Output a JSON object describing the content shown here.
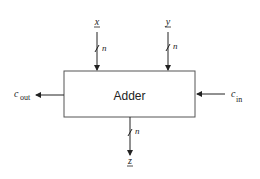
{
  "diagram": {
    "block": {
      "label": "Adder"
    },
    "inputs": {
      "x": {
        "label": "x",
        "width_label": "n"
      },
      "y": {
        "label": "y",
        "width_label": "n"
      },
      "cin": {
        "label": "c",
        "subscript": "in"
      }
    },
    "outputs": {
      "z": {
        "label": "z",
        "width_label": "n"
      },
      "cout": {
        "label": "c",
        "subscript": "out"
      }
    },
    "colors": {
      "line": "#222222",
      "box_border": "#555555",
      "background": "#ffffff"
    }
  }
}
